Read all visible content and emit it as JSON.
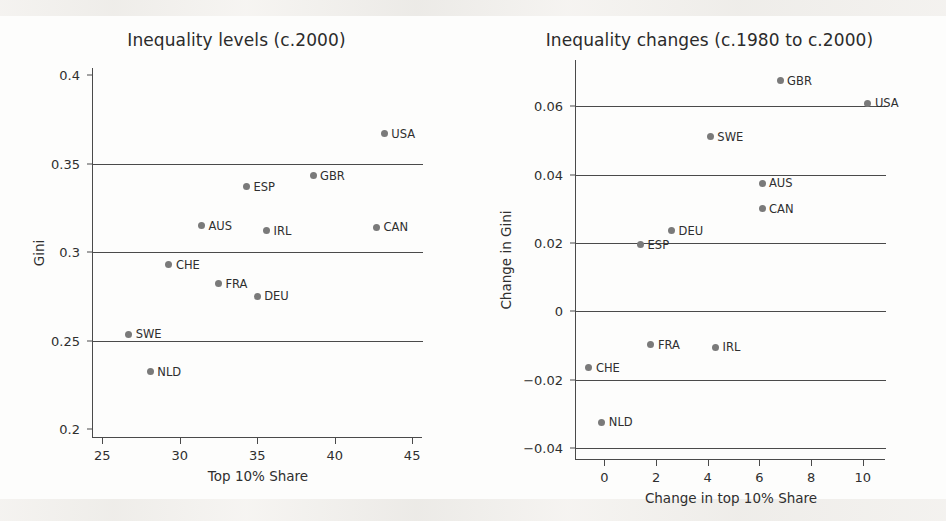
{
  "figure": {
    "background_color": "#fdfdfc",
    "marker_color": "#7a7a7a",
    "axis_color": "#4a4a4a",
    "text_color": "#2f2f2f"
  },
  "chart_data": [
    {
      "type": "scatter",
      "panel": "left",
      "title": "Inequality levels (c.2000)",
      "xlabel": "Top 10% Share",
      "ylabel": "Gini",
      "xlim": [
        24.4,
        45.7
      ],
      "ylim": [
        0.195,
        0.404
      ],
      "xticks": [
        25,
        30,
        35,
        40,
        45
      ],
      "xtick_labels": [
        "25",
        "30",
        "35",
        "40",
        "45"
      ],
      "yticks": [
        0.2,
        0.25,
        0.3,
        0.35,
        0.4
      ],
      "ytick_labels": [
        "0.2",
        "0.25",
        "0.3",
        "0.35",
        "0.4"
      ],
      "gridlines_y": [
        0.25,
        0.3,
        0.35
      ],
      "grid": "horizontal",
      "legend": "none",
      "points": [
        {
          "label": "USA",
          "x": 43.2,
          "y": 0.367,
          "label_side": "right"
        },
        {
          "label": "GBR",
          "x": 38.6,
          "y": 0.343,
          "label_side": "right"
        },
        {
          "label": "ESP",
          "x": 34.3,
          "y": 0.337,
          "label_side": "right"
        },
        {
          "label": "AUS",
          "x": 31.4,
          "y": 0.315,
          "label_side": "right"
        },
        {
          "label": "CAN",
          "x": 42.7,
          "y": 0.314,
          "label_side": "right"
        },
        {
          "label": "IRL",
          "x": 35.6,
          "y": 0.312,
          "label_side": "right"
        },
        {
          "label": "CHE",
          "x": 29.3,
          "y": 0.293,
          "label_side": "right"
        },
        {
          "label": "FRA",
          "x": 32.5,
          "y": 0.282,
          "label_side": "right"
        },
        {
          "label": "DEU",
          "x": 35.0,
          "y": 0.275,
          "label_side": "right"
        },
        {
          "label": "SWE",
          "x": 26.7,
          "y": 0.2535,
          "label_side": "right"
        },
        {
          "label": "NLD",
          "x": 28.1,
          "y": 0.2325,
          "label_side": "right"
        }
      ]
    },
    {
      "type": "scatter",
      "panel": "right",
      "title": "Inequality changes (c.1980 to c.2000)",
      "xlabel": "Change in top 10% Share",
      "ylabel": "Change in Gini",
      "xlim": [
        -1.1,
        10.9
      ],
      "ylim": [
        -0.0435,
        0.0735
      ],
      "xticks": [
        0,
        2,
        4,
        6,
        8,
        10
      ],
      "xtick_labels": [
        "0",
        "2",
        "4",
        "6",
        "8",
        "10"
      ],
      "yticks": [
        -0.04,
        -0.02,
        0,
        0.02,
        0.04,
        0.06
      ],
      "ytick_labels": [
        "−0.04",
        "−0.02",
        "0",
        "0.02",
        "0.04",
        "0.06"
      ],
      "gridlines_y": [
        -0.04,
        -0.02,
        0,
        0.02,
        0.04,
        0.06
      ],
      "grid": "horizontal",
      "legend": "none",
      "points": [
        {
          "label": "GBR",
          "x": 6.8,
          "y": 0.0675,
          "label_side": "right"
        },
        {
          "label": "USA",
          "x": 10.2,
          "y": 0.0608,
          "label_side": "right"
        },
        {
          "label": "SWE",
          "x": 4.1,
          "y": 0.051,
          "label_side": "right"
        },
        {
          "label": "AUS",
          "x": 6.1,
          "y": 0.0375,
          "label_side": "right"
        },
        {
          "label": "CAN",
          "x": 6.1,
          "y": 0.03,
          "label_side": "right"
        },
        {
          "label": "DEU",
          "x": 2.6,
          "y": 0.0235,
          "label_side": "right"
        },
        {
          "label": "ESP",
          "x": 1.4,
          "y": 0.0195,
          "label_side": "right"
        },
        {
          "label": "FRA",
          "x": 1.8,
          "y": -0.0098,
          "label_side": "right"
        },
        {
          "label": "IRL",
          "x": 4.3,
          "y": -0.0105,
          "label_side": "right"
        },
        {
          "label": "CHE",
          "x": -0.6,
          "y": -0.0165,
          "label_side": "right"
        },
        {
          "label": "NLD",
          "x": -0.1,
          "y": -0.0325,
          "label_side": "right"
        }
      ]
    }
  ]
}
